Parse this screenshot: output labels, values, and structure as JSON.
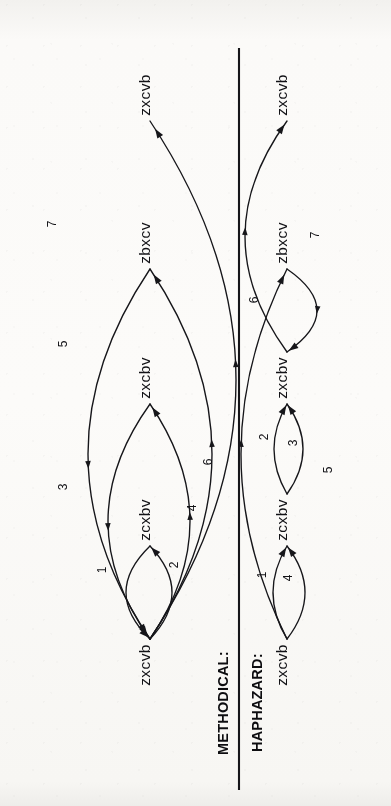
{
  "figure": {
    "background_color": "#fbfaf8",
    "ink_color": "#16161a",
    "orientation": "rotated-90-ccw",
    "divider": {
      "x": 239,
      "y1": 48,
      "y2": 790
    }
  },
  "rows": [
    {
      "id": "methodical",
      "label": "METHODICAL:",
      "label_x": 228,
      "label_y": 755,
      "axis_x": 150,
      "nodes": [
        {
          "label": "zxcvb",
          "x": 150,
          "y": 665
        },
        {
          "label": "zcxbv",
          "x": 150,
          "y": 520
        },
        {
          "label": "zxcbv",
          "x": 150,
          "y": 378
        },
        {
          "label": "zbxcv",
          "x": 150,
          "y": 243
        },
        {
          "label": "zxcvb",
          "x": 150,
          "y": 95
        }
      ],
      "edges": [
        {
          "n": "1",
          "from": 0,
          "to": 1,
          "dir": "forward",
          "bow": 22,
          "label_x": 106,
          "label_y": 570
        },
        {
          "n": "2",
          "from": 1,
          "to": 0,
          "dir": "back",
          "bow": -24,
          "label_x": 178,
          "label_y": 565
        },
        {
          "n": "3",
          "from": 0,
          "to": 2,
          "dir": "forward",
          "bow": 40,
          "label_x": 67,
          "label_y": 487
        },
        {
          "n": "4",
          "from": 2,
          "to": 0,
          "dir": "back",
          "bow": -42,
          "label_x": 196,
          "label_y": 508
        },
        {
          "n": "5",
          "from": 0,
          "to": 3,
          "dir": "forward",
          "bow": 62,
          "label_x": 67,
          "label_y": 344
        },
        {
          "n": "6",
          "from": 3,
          "to": 0,
          "dir": "back",
          "bow": -62,
          "label_x": 212,
          "label_y": 462
        },
        {
          "n": "7",
          "from": 0,
          "to": 4,
          "dir": "forward",
          "bow": 86,
          "label_x": 56,
          "label_y": 224
        }
      ]
    },
    {
      "id": "haphazard",
      "label": "HAPHAZARD:",
      "label_x": 262,
      "label_y": 752,
      "axis_x": 287,
      "nodes": [
        {
          "label": "zxcvb",
          "x": 287,
          "y": 665
        },
        {
          "label": "zcxbv",
          "x": 287,
          "y": 520
        },
        {
          "label": "zxcbv",
          "x": 287,
          "y": 378
        },
        {
          "label": "zbxcv",
          "x": 287,
          "y": 243
        },
        {
          "label": "zxcvb",
          "x": 287,
          "y": 95
        }
      ],
      "edges": [
        {
          "n": "1",
          "from": 0,
          "to": 1,
          "dir": "forward",
          "bow": 18,
          "label_x": 266,
          "label_y": 575
        },
        {
          "n": "2",
          "from": 1,
          "to": 2,
          "dir": "forward",
          "bow": 16,
          "label_x": 268,
          "label_y": 437
        },
        {
          "n": "3",
          "from": 1,
          "to": 2,
          "dir": "forward",
          "bow": -13,
          "label_x": 297,
          "label_y": 443
        },
        {
          "n": "4",
          "from": 0,
          "to": 1,
          "dir": "forward",
          "bow": -14,
          "label_x": 292,
          "label_y": 578
        },
        {
          "n": "5",
          "from": 0,
          "to": 3,
          "dir": "forward",
          "bow": -46,
          "label_x": 332,
          "label_y": 470
        },
        {
          "n": "6",
          "from": 3,
          "to": 2,
          "dir": "back",
          "bow": 30,
          "label_x": 258,
          "label_y": 300
        },
        {
          "n": "7",
          "from": 2,
          "to": 4,
          "dir": "forward",
          "bow": -42,
          "label_x": 319,
          "label_y": 235
        }
      ]
    }
  ]
}
